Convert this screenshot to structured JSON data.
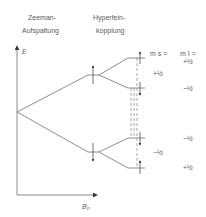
{
  "headings": {
    "zeeman_line1": "Zeeman-",
    "zeeman_line2": "Aufspaltung",
    "hyperfine_line1": "Hyperfein-",
    "hyperfine_line2": "kopplung"
  },
  "axes": {
    "y_label": "E",
    "x_label": "B₀"
  },
  "quantum_numbers": {
    "ms_header": "m s =",
    "mi_header": "m I =",
    "ms_values": [
      "+½",
      "−½"
    ],
    "mi_values": [
      "+½",
      "−½",
      "−½",
      "+½"
    ]
  },
  "colors": {
    "line": "#707070",
    "text": "#5a5a5a",
    "background": "#ffffff"
  }
}
